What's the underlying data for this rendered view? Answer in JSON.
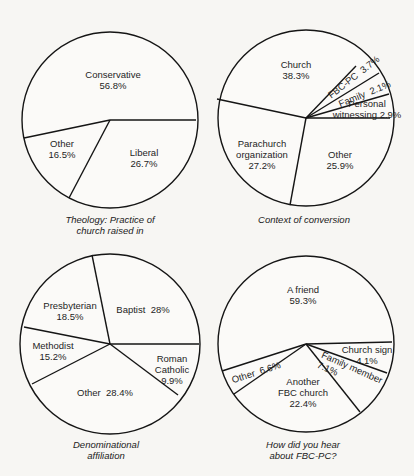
{
  "chart_data": [
    {
      "type": "pie",
      "title": "Theology: Practice of church raised in",
      "caption": "Theology: Practice of\nchurch raised in",
      "center": [
        110,
        120
      ],
      "radius": 88,
      "boundaries": [
        [
          196,
          120
        ],
        [
          69,
          198
        ],
        [
          24,
          138
        ]
      ],
      "slices": [
        {
          "label": "Conservative",
          "value": 56.8,
          "text": "Conservative\n56.8%",
          "pos": [
            113,
            80
          ],
          "rot": 0
        },
        {
          "label": "Liberal",
          "value": 26.7,
          "text": "Liberal\n26.7%",
          "pos": [
            144,
            158
          ],
          "rot": 0
        },
        {
          "label": "Other",
          "value": 16.5,
          "text": "Other\n16.5%",
          "pos": [
            62,
            149
          ],
          "rot": 0
        }
      ],
      "caption_pos": [
        110,
        214
      ]
    },
    {
      "type": "pie",
      "title": "Context of conversion",
      "caption": "Context of conversion",
      "center": [
        306,
        118
      ],
      "radius": 88,
      "boundaries": [
        [
          390,
          118
        ],
        [
          290,
          205
        ],
        [
          217,
          99
        ],
        [
          356,
          66
        ],
        [
          379,
          73
        ],
        [
          389,
          94
        ]
      ],
      "slices": [
        {
          "label": "Church",
          "value": 38.3,
          "text": "Church\n38.3%",
          "pos": [
            296,
            70
          ],
          "rot": 0
        },
        {
          "label": "FBC-PC",
          "value": 3.7,
          "text": "FBC-PC  3.7%",
          "pos": [
            329,
            96
          ],
          "rot": -38
        },
        {
          "label": "Family",
          "value": 2.1,
          "text": "Family  2.1%",
          "pos": [
            339,
            104
          ],
          "rot": -22
        },
        {
          "label": "Personal witnessing",
          "value": 2.9,
          "text": "Personal\nwitnessing 2.9%",
          "pos": [
            367,
            109
          ],
          "rot": 0
        },
        {
          "label": "Other",
          "value": 25.9,
          "text": "Other\n25.9%",
          "pos": [
            340,
            160
          ],
          "rot": 0
        },
        {
          "label": "Parachurch organization",
          "value": 27.2,
          "text": "Parachurch\norganization\n27.2%",
          "pos": [
            262,
            154
          ],
          "rot": 0
        }
      ],
      "caption_pos": [
        304,
        214
      ]
    },
    {
      "type": "pie",
      "title": "Denominational affiliation",
      "caption": "Denominational\naffiliation",
      "center": [
        110,
        344
      ],
      "radius": 90,
      "boundaries": [
        [
          199,
          344
        ],
        [
          92,
          255
        ],
        [
          24,
          327
        ],
        [
          32,
          384
        ],
        [
          178,
          395
        ]
      ],
      "slices": [
        {
          "label": "Baptist",
          "value": 28,
          "text": "Baptist  28%",
          "pos": [
            143,
            309
          ],
          "rot": 0
        },
        {
          "label": "Presbyterian",
          "value": 18.5,
          "text": "Presbyterian\n18.5%",
          "pos": [
            70,
            311
          ],
          "rot": 0
        },
        {
          "label": "Methodist",
          "value": 15.2,
          "text": "Methodist\n15.2%",
          "pos": [
            53,
            351
          ],
          "rot": 0
        },
        {
          "label": "Other",
          "value": 28.4,
          "text": "Other  28.4%",
          "pos": [
            105,
            392
          ],
          "rot": 0
        },
        {
          "label": "Roman Catholic",
          "value": 9.9,
          "text": "Roman\nCatholic\n9.9%",
          "pos": [
            172,
            369
          ],
          "rot": 0
        }
      ],
      "caption_pos": [
        106,
        439
      ]
    },
    {
      "type": "pie",
      "title": "How did you hear about FBC-PC?",
      "caption": "How did you hear\nabout FBC-PC?",
      "center": [
        306,
        344
      ],
      "radius": 88,
      "boundaries": [
        [
          392,
          342
        ],
        [
          387,
          373
        ],
        [
          360,
          412
        ],
        [
          234,
          394
        ],
        [
          222,
          371
        ]
      ],
      "slices": [
        {
          "label": "A friend",
          "value": 59.3,
          "text": "A friend\n59.3%",
          "pos": [
            303,
            295
          ],
          "rot": 0
        },
        {
          "label": "Church sign",
          "value": 4.1,
          "text": "Church sign\n4.1%",
          "pos": [
            367,
            355
          ],
          "rot": 0
        },
        {
          "label": "Family member",
          "value": 7.1,
          "text": "Family member\n7.1%",
          "pos": [
            320,
            359
          ],
          "rot": 24
        },
        {
          "label": "Another FBC church",
          "value": 22.4,
          "text": "Another\nFBC church\n22.4%",
          "pos": [
            303,
            392
          ],
          "rot": 0
        },
        {
          "label": "Other",
          "value": 6.6,
          "text": "Other  6.6%",
          "pos": [
            232,
            380
          ],
          "rot": -18
        }
      ],
      "caption_pos": [
        303,
        439
      ]
    }
  ]
}
